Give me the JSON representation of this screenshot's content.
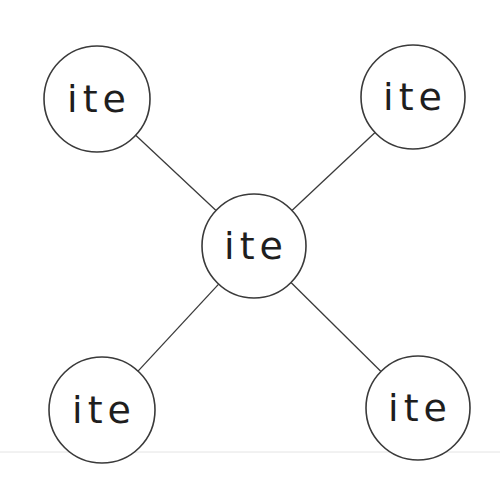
{
  "diagram": {
    "type": "star",
    "center": {
      "id": "center",
      "label": "ite",
      "x": 254,
      "y": 246,
      "r": 52
    },
    "nodes": [
      {
        "id": "top-left",
        "label": "ite",
        "x": 97,
        "y": 99,
        "r": 53
      },
      {
        "id": "top-right",
        "label": "ite",
        "x": 413,
        "y": 97,
        "r": 52
      },
      {
        "id": "bottom-left",
        "label": "ite",
        "x": 102,
        "y": 410,
        "r": 53
      },
      {
        "id": "bottom-right",
        "label": "ite",
        "x": 418,
        "y": 408,
        "r": 52
      }
    ],
    "edges": [
      {
        "from": "center",
        "to": "top-left"
      },
      {
        "from": "center",
        "to": "top-right"
      },
      {
        "from": "center",
        "to": "bottom-left"
      },
      {
        "from": "center",
        "to": "bottom-right"
      }
    ],
    "colors": {
      "stroke": "#3a3a3a",
      "text": "#1e1e1e",
      "background": "#ffffff"
    }
  }
}
